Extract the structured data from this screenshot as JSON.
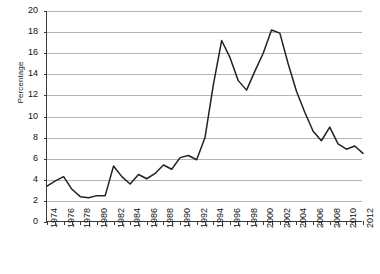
{
  "chart_data": {
    "type": "line",
    "title": "",
    "xlabel": "",
    "ylabel": "Percentage",
    "ylim": [
      0,
      20
    ],
    "ytick_step": 2,
    "yticks": [
      "0",
      "2",
      "4",
      "6",
      "8",
      "10",
      "12",
      "14",
      "16",
      "18",
      "20"
    ],
    "grid": true,
    "legend": "none",
    "x": [
      1974,
      1975,
      1976,
      1977,
      1978,
      1979,
      1980,
      1981,
      1982,
      1983,
      1984,
      1985,
      1986,
      1987,
      1988,
      1989,
      1990,
      1991,
      1992,
      1993,
      1994,
      1995,
      1996,
      1997,
      1998,
      1999,
      2000,
      2001,
      2002,
      2003,
      2004,
      2005,
      2006,
      2007,
      2008,
      2009,
      2010,
      2011,
      2012
    ],
    "xtick_labels": [
      "1974",
      "1976",
      "1978",
      "1980",
      "1982",
      "1984",
      "1986",
      "1988",
      "1990",
      "1992",
      "1994",
      "1996",
      "1998",
      "2000",
      "2002",
      "2004",
      "2006",
      "2008",
      "2010",
      "2012"
    ],
    "xlim": [
      1974,
      2012
    ],
    "series": [
      {
        "name": "Percentage",
        "color": "#222222",
        "values": [
          3.4,
          3.9,
          4.3,
          3.1,
          2.4,
          2.3,
          2.5,
          2.5,
          5.3,
          4.3,
          3.6,
          4.5,
          4.1,
          4.6,
          5.4,
          5.0,
          6.1,
          6.3,
          5.9,
          8.0,
          13.0,
          17.2,
          15.6,
          13.4,
          12.5,
          14.3,
          16.0,
          18.2,
          17.9,
          15.0,
          12.4,
          10.4,
          8.6,
          7.7,
          9.0,
          7.4,
          6.9,
          7.2,
          6.5
        ]
      }
    ]
  }
}
